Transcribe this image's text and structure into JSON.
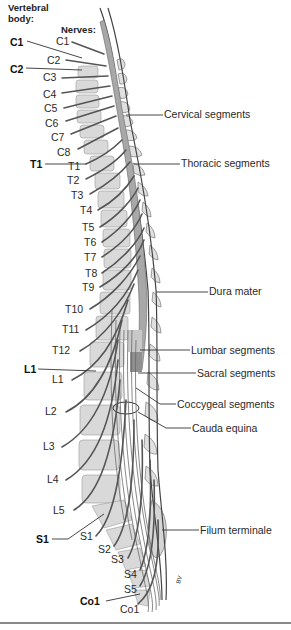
{
  "headers": {
    "vertebral_body": "Vertebral\nbody:",
    "vertebral_body_line1": "Vertebral",
    "vertebral_body_line2": "body:",
    "nerves": "Nerves:"
  },
  "vertebral_labels": [
    {
      "text": "C1",
      "x": 10,
      "y": 36
    },
    {
      "text": "C2",
      "x": 10,
      "y": 63
    },
    {
      "text": "T1",
      "x": 30,
      "y": 159
    },
    {
      "text": "L1",
      "x": 24,
      "y": 364
    },
    {
      "text": "S1",
      "x": 36,
      "y": 534
    },
    {
      "text": "Co1",
      "x": 80,
      "y": 596
    }
  ],
  "nerve_labels": [
    {
      "text": "C1",
      "x": 56,
      "y": 36
    },
    {
      "text": "C2",
      "x": 47,
      "y": 55
    },
    {
      "text": "C3",
      "x": 43,
      "y": 72
    },
    {
      "text": "C4",
      "x": 43,
      "y": 89
    },
    {
      "text": "C5",
      "x": 44,
      "y": 103
    },
    {
      "text": "C6",
      "x": 45,
      "y": 118
    },
    {
      "text": "C7",
      "x": 51,
      "y": 132
    },
    {
      "text": "C8",
      "x": 57,
      "y": 147
    },
    {
      "text": "T1",
      "x": 68,
      "y": 161
    },
    {
      "text": "T2",
      "x": 67,
      "y": 175
    },
    {
      "text": "T3",
      "x": 71,
      "y": 190
    },
    {
      "text": "T4",
      "x": 80,
      "y": 205
    },
    {
      "text": "T5",
      "x": 82,
      "y": 222
    },
    {
      "text": "T6",
      "x": 84,
      "y": 237
    },
    {
      "text": "T7",
      "x": 84,
      "y": 252
    },
    {
      "text": "T8",
      "x": 85,
      "y": 268
    },
    {
      "text": "T9",
      "x": 82,
      "y": 282
    },
    {
      "text": "T10",
      "x": 65,
      "y": 304
    },
    {
      "text": "T11",
      "x": 62,
      "y": 324
    },
    {
      "text": "T12",
      "x": 52,
      "y": 345
    },
    {
      "text": "L1",
      "x": 52,
      "y": 374
    },
    {
      "text": "L2",
      "x": 45,
      "y": 406
    },
    {
      "text": "L3",
      "x": 43,
      "y": 441
    },
    {
      "text": "L4",
      "x": 47,
      "y": 474
    },
    {
      "text": "L5",
      "x": 53,
      "y": 505
    },
    {
      "text": "S1",
      "x": 80,
      "y": 531
    },
    {
      "text": "S2",
      "x": 98,
      "y": 544
    },
    {
      "text": "S3",
      "x": 111,
      "y": 554
    },
    {
      "text": "S4",
      "x": 124,
      "y": 569
    },
    {
      "text": "S5",
      "x": 124,
      "y": 584
    },
    {
      "text": "Co1",
      "x": 120,
      "y": 604
    }
  ],
  "right_labels": [
    {
      "text": "Cervical segments",
      "x": 164,
      "y": 108,
      "line_from_x": 140,
      "line_y": 115
    },
    {
      "text": "Thoracic segments",
      "x": 181,
      "y": 157,
      "line_from_x": 150,
      "line_y": 164
    },
    {
      "text": "Dura mater",
      "x": 209,
      "y": 285,
      "line_from_x": 158,
      "line_y": 292
    },
    {
      "text": "Lumbar segments",
      "x": 191,
      "y": 345,
      "line_from_x": 150,
      "line_y": 350
    },
    {
      "text": "Sacral segments",
      "x": 197,
      "y": 367,
      "line_from_x": 150,
      "line_y": 373
    },
    {
      "text": "Coccygeal segments",
      "x": 177,
      "y": 401,
      "line_from_x": 140,
      "line_y": 404
    },
    {
      "text": "Cauda equina",
      "x": 192,
      "y": 425,
      "line_from_x": 135,
      "line_y": 422
    },
    {
      "text": "Filum terminale",
      "x": 200,
      "y": 523,
      "line_from_x": 165,
      "line_y": 530
    }
  ],
  "labels": {
    "C1_vertebra": "C1",
    "C2_vertebra": "C2",
    "T1_vertebra": "T1",
    "L1_vertebra": "L1",
    "S1_vertebra": "S1",
    "Co1_vertebra": "Co1",
    "cervical": "Cervical segments",
    "thoracic": "Thoracic segments",
    "dura": "Dura mater",
    "lumbar": "Lumbar segments",
    "sacral": "Sacral segments",
    "coccygeal": "Coccygeal segments",
    "cauda": "Cauda equina",
    "filum": "Filum terminale",
    "artist_mark": "BV"
  },
  "colors": {
    "vertebra_fill": "#d9d9d9",
    "cord_fill": "#a8a8a8",
    "nerve_stroke": "#555555",
    "line": "#333333",
    "background": "#ffffff"
  }
}
